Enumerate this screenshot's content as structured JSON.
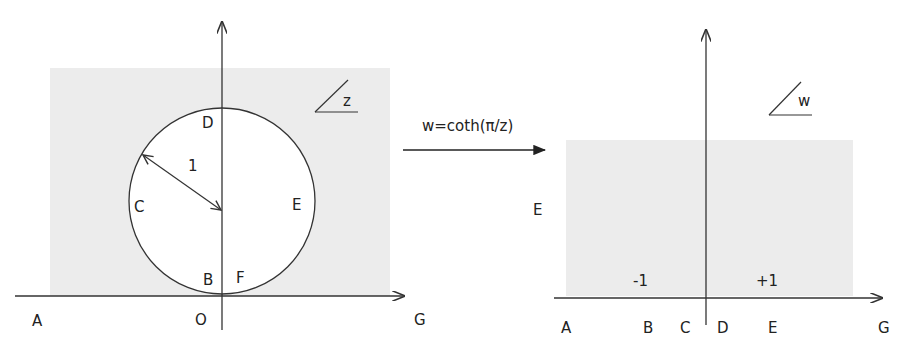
{
  "mapping": {
    "formula": "w=coth(π/z)"
  },
  "z_plane": {
    "plane_label": "z",
    "radius_label": "1",
    "points": {
      "A": "A",
      "B": "B",
      "C": "C",
      "D": "D",
      "E": "E",
      "F": "F",
      "G": "G",
      "O": "O"
    }
  },
  "w_plane": {
    "plane_label": "w",
    "tick_minus": "-1",
    "tick_plus": "+1",
    "points": {
      "A": "A",
      "B": "B",
      "C": "C",
      "D": "D",
      "E_axis": "E",
      "E_left": "E",
      "G": "G"
    }
  },
  "colors": {
    "shade": "#ececec",
    "line": "#333333"
  }
}
